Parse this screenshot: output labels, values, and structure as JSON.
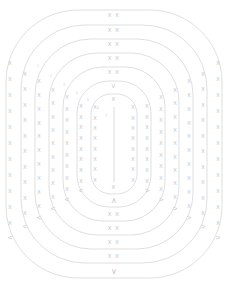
{
  "figure": {
    "title": "",
    "background_color": "#ffffff",
    "stroke_color": "#c9c9cf",
    "glyph_color": "#c2c2ca"
  },
  "chart_data": {
    "type": "scatter",
    "title": "",
    "subtitle": "",
    "xlabel": "",
    "ylabel": "",
    "grid": false,
    "legend": "none",
    "center": [
      114,
      144
    ],
    "ring_count": 7,
    "rings": [
      {
        "index": 1,
        "label": "1",
        "half_width": 108,
        "half_height": 134,
        "corner_radius": 72,
        "top_glyph": "X X",
        "bottom_glyph": "V",
        "left_glyph": "<",
        "right_glyph": ">",
        "side_glyph": "X",
        "side_glyph_count": 11
      },
      {
        "index": 2,
        "label": "2",
        "half_width": 93,
        "half_height": 119,
        "corner_radius": 64,
        "top_glyph": "X X",
        "bottom_glyph": "X X",
        "left_glyph": "<",
        "right_glyph": ">",
        "side_glyph": "X",
        "side_glyph_count": 10
      },
      {
        "index": 3,
        "label": "3",
        "half_width": 79,
        "half_height": 105,
        "corner_radius": 56,
        "top_glyph": "X X",
        "bottom_glyph": "X X",
        "left_glyph": "<",
        "right_glyph": ">",
        "side_glyph": "X",
        "side_glyph_count": 10
      },
      {
        "index": 4,
        "label": "4",
        "half_width": 65,
        "half_height": 91,
        "corner_radius": 48,
        "top_glyph": "X X",
        "bottom_glyph": "X X",
        "left_glyph": "<",
        "right_glyph": ">",
        "side_glyph": "X",
        "side_glyph_count": 9
      },
      {
        "index": 5,
        "label": "5",
        "half_width": 51,
        "half_height": 77,
        "corner_radius": 40,
        "top_glyph": "X X",
        "bottom_glyph": "X X",
        "left_glyph": "<",
        "right_glyph": ">",
        "side_glyph": "X",
        "side_glyph_count": 9
      },
      {
        "index": 6,
        "label": "6",
        "half_width": 37,
        "half_height": 63,
        "corner_radius": 32,
        "top_glyph": "V",
        "bottom_glyph": "A",
        "left_glyph": "<",
        "right_glyph": ">",
        "side_glyph": "X",
        "side_glyph_count": 8
      },
      {
        "index": 7,
        "label": "7",
        "half_width": 23,
        "half_height": 50,
        "corner_radius": 20,
        "top_glyph": "X",
        "bottom_glyph": "X",
        "left_glyph": "X",
        "right_glyph": "X",
        "side_glyph": "X",
        "side_glyph_count": 8
      }
    ],
    "spine": {
      "orientation": "vertical",
      "x": 114,
      "y_top": 107,
      "y_bottom": 182,
      "glyph": "|"
    },
    "diagonal_labels": [
      {
        "text": "1",
        "x": 38,
        "y": 66
      },
      {
        "text": "2",
        "x": 51,
        "y": 76
      },
      {
        "text": "3",
        "x": 64,
        "y": 85
      },
      {
        "text": "4",
        "x": 77,
        "y": 93
      },
      {
        "text": "5",
        "x": 88,
        "y": 100
      },
      {
        "text": "6",
        "x": 98,
        "y": 108
      },
      {
        "text": "7",
        "x": 106,
        "y": 116
      }
    ]
  },
  "glyphs": {
    "x_mark": "X",
    "chevron_down": "V",
    "chevron_up": "A",
    "chevron_left": "<",
    "chevron_right": ">",
    "pair": "X X"
  }
}
